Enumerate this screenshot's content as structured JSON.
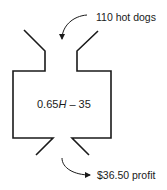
{
  "diagram": {
    "type": "function-machine",
    "input": {
      "label": "110 hot dogs"
    },
    "function": {
      "prefix": "0.65",
      "variable": "H",
      "suffix": " – 35"
    },
    "output": {
      "label": "$36.50 profit"
    },
    "colors": {
      "stroke": "#1a1a1a",
      "background": "#ffffff"
    }
  }
}
